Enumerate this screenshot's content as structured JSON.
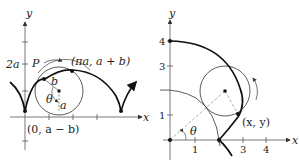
{
  "left_figure": {
    "axis_labels": {
      "x": "x",
      "y": "y"
    },
    "y_tick_label": "2a",
    "point_P": "P",
    "point_top": "(πa, a + b)",
    "point_cusp": "(0, a − b)",
    "radius_b": "b",
    "radius_a": "a",
    "angle": "θ"
  },
  "right_figure": {
    "axis_labels": {
      "x": "x",
      "y": "y"
    },
    "x_ticks": [
      "1",
      "3",
      "4"
    ],
    "y_ticks": [
      "1",
      "3",
      "4"
    ],
    "point_xy": "(x, y)",
    "angle": "θ"
  }
}
